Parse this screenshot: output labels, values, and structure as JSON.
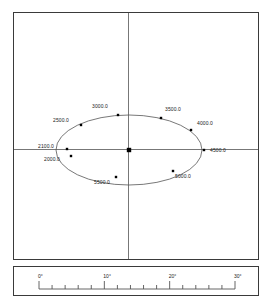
{
  "chart_data": {
    "type": "scatter",
    "title": "",
    "xlabel": "",
    "ylabel": "",
    "grid": false,
    "legend": null,
    "axes": {
      "horizontal_axis": true,
      "vertical_axis": true,
      "origin_marker": "filled-square"
    },
    "ellipse": {
      "center_x": 128,
      "center_y": 149,
      "semi_major_px": 73,
      "semi_minor_px": 35,
      "rotation_deg": 0
    },
    "points": [
      {
        "label": "3000.0",
        "value": 3000.0,
        "px": 117,
        "py": 114,
        "label_dx": -26,
        "label_dy": -9
      },
      {
        "label": "3500.0",
        "value": 3500.0,
        "px": 160,
        "py": 117,
        "label_dx": 4,
        "label_dy": -9
      },
      {
        "label": "4000.0",
        "value": 4000.0,
        "px": 190,
        "py": 129,
        "label_dx": 6,
        "label_dy": -7
      },
      {
        "label": "4500.0",
        "value": 4500.0,
        "px": 203,
        "py": 149,
        "label_dx": 6,
        "label_dy": 0
      },
      {
        "label": "5000.0",
        "value": 5000.0,
        "px": 172,
        "py": 170,
        "label_dx": 2,
        "label_dy": 5
      },
      {
        "label": "5500.0",
        "value": 5500.0,
        "px": 115,
        "py": 176,
        "label_dx": -22,
        "label_dy": 5
      },
      {
        "label": "2000.0",
        "value": 2000.0,
        "px": 70,
        "py": 155,
        "label_dx": -27,
        "label_dy": 3
      },
      {
        "label": "2100.0",
        "value": 2100.0,
        "px": 66,
        "py": 148,
        "label_dx": -29,
        "label_dy": -3
      },
      {
        "label": "2500.0",
        "value": 2500.0,
        "px": 80,
        "py": 124,
        "label_dx": -28,
        "label_dy": -5
      }
    ],
    "scale_bar": {
      "unit": "degrees",
      "major_ticks": [
        {
          "label": "0°",
          "value": 0
        },
        {
          "label": "10°",
          "value": 10
        },
        {
          "label": "20°",
          "value": 20
        },
        {
          "label": "30°",
          "value": 30
        }
      ],
      "minor_tick_interval": 2,
      "range": [
        0,
        30
      ]
    }
  },
  "colors": {
    "frame": "#3a3a3a",
    "axis": "#777777",
    "ellipse": "#555555",
    "point": "#000000",
    "text": "#1a1a1a",
    "background": "#ffffff"
  }
}
